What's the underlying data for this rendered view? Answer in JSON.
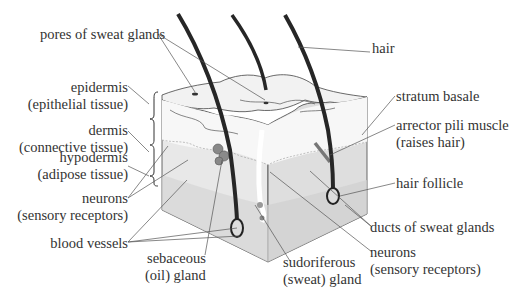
{
  "diagram": {
    "labels": {
      "pores": "pores of sweat glands",
      "hair": "hair",
      "epidermis_1": "epidermis",
      "epidermis_2": "(epithelial tissue)",
      "dermis_1": "dermis",
      "dermis_2": "(connective tissue)",
      "hypodermis_1": "hypodermis",
      "hypodermis_2": "(adipose tissue)",
      "neurons_left_1": "neurons",
      "neurons_left_2": "(sensory receptors)",
      "blood_vessels": "blood vessels",
      "sebaceous_1": "sebaceous",
      "sebaceous_2": "(oil) gland",
      "sudoriferous_1": "sudoriferous",
      "sudoriferous_2": "(sweat) gland",
      "stratum_basale": "stratum basale",
      "arrector_1": "arrector pili muscle",
      "arrector_2": "(raises hair)",
      "hair_follicle": "hair follicle",
      "ducts": "ducts of sweat glands",
      "neurons_right_1": "neurons",
      "neurons_right_2": "(sensory receptors)"
    },
    "colors": {
      "epidermis": "#f4f4f4",
      "dermis": "#e6e6e6",
      "hypodermis": "#d9d9d9",
      "hair": "#262626",
      "leader": "#555555",
      "outline": "#444444"
    }
  }
}
